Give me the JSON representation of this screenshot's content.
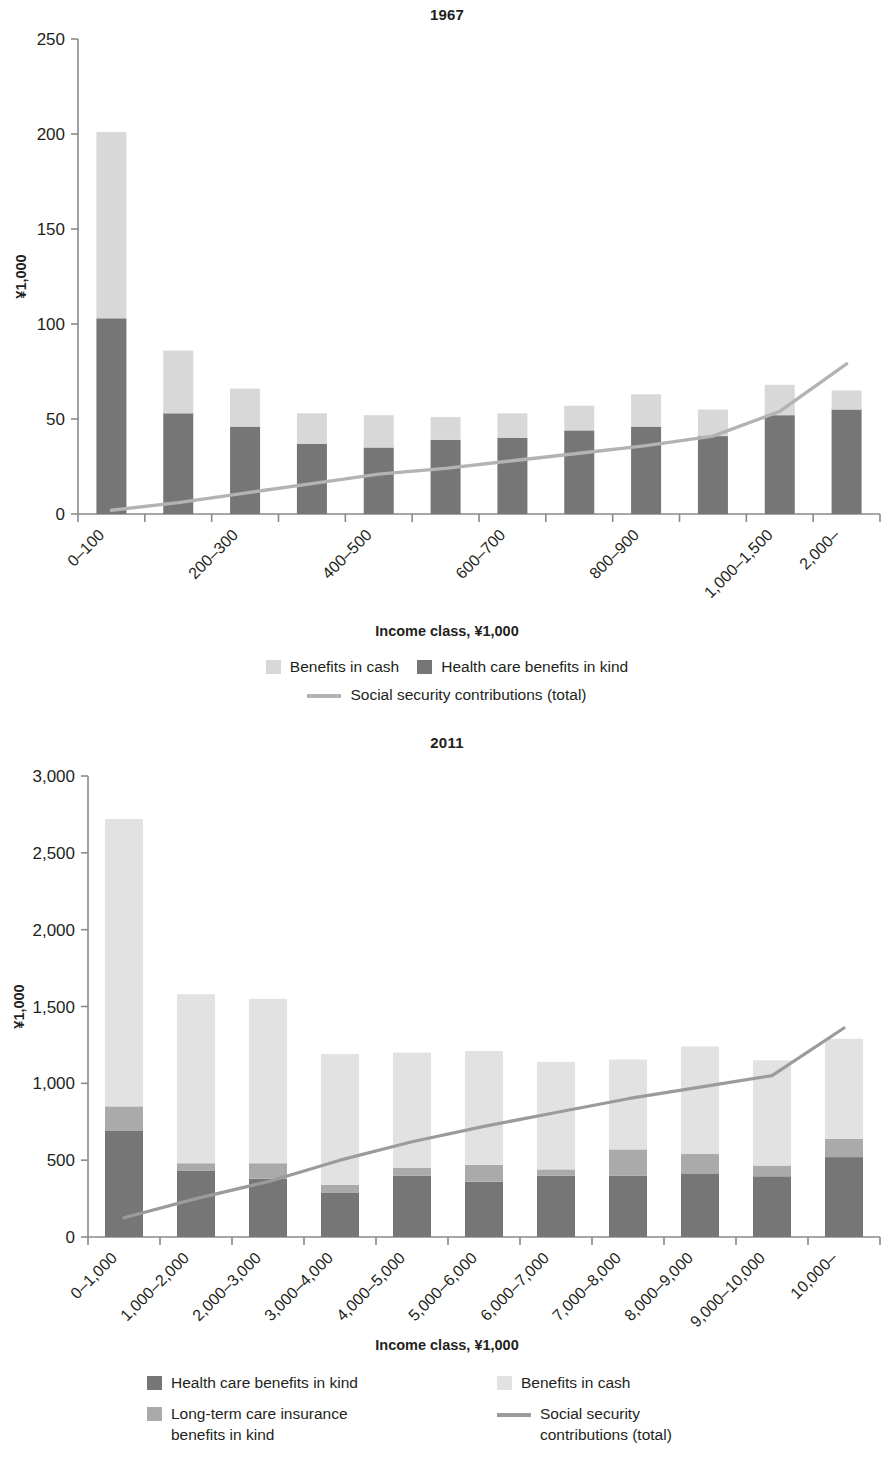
{
  "colors": {
    "dark_gray": "#767676",
    "mid_gray": "#aaaaaa",
    "light_gray": "#d8d8d8",
    "line_gray": "#b3b3b3",
    "line_gray_2011": "#9b9b9b",
    "axis": "#8a8a8a",
    "text": "#231f20"
  },
  "chart_data": [
    {
      "type": "bar",
      "id": "chart-1967",
      "title": "1967",
      "xlabel": "Income class, ¥1,000",
      "ylabel": "¥1,000",
      "ylim": [
        0,
        250
      ],
      "yticks": [
        0,
        50,
        100,
        150,
        200,
        250
      ],
      "ytick_labels": [
        "0",
        "50",
        "100",
        "150",
        "200",
        "250"
      ],
      "grid": false,
      "legend_position": "bottom",
      "stacked": true,
      "categories": [
        "0–100",
        "100–200",
        "200–300",
        "300–400",
        "400–500",
        "500–600",
        "600–700",
        "700–800",
        "800–900",
        "900–1,000",
        "1,000–1,500",
        "2,000–"
      ],
      "visible_tick_labels": [
        "0–100",
        "",
        "200–300",
        "",
        "400–500",
        "",
        "600–700",
        "",
        "800–900",
        "",
        "1,000–1,500",
        "2,000–"
      ],
      "series": [
        {
          "name": "Health care benefits in kind",
          "color": "#767676",
          "values": [
            103,
            53,
            46,
            37,
            35,
            39,
            40,
            44,
            46,
            41,
            52,
            55
          ]
        },
        {
          "name": "Benefits in cash",
          "color": "#d8d8d8",
          "values": [
            98,
            33,
            20,
            16,
            17,
            12,
            13,
            13,
            17,
            14,
            16,
            10
          ]
        }
      ],
      "totals": [
        201,
        86,
        66,
        53,
        52,
        51,
        53,
        57,
        63,
        55,
        68,
        75
      ],
      "line_series": {
        "name": "Social security contributions (total)",
        "color": "#b3b3b3",
        "values": [
          2,
          6,
          11,
          16,
          21,
          24,
          28,
          32,
          36,
          41,
          54,
          79
        ]
      },
      "legend": [
        {
          "label": "Benefits in cash",
          "marker": "swatch",
          "color": "#d8d8d8"
        },
        {
          "label": "Health care benefits in kind",
          "marker": "swatch",
          "color": "#767676"
        },
        {
          "label": "Social security contributions (total)",
          "marker": "line",
          "color": "#b3b3b3"
        }
      ]
    },
    {
      "type": "bar",
      "id": "chart-2011",
      "title": "2011",
      "xlabel": "Income class, ¥1,000",
      "ylabel": "¥1,000",
      "ylim": [
        0,
        3000
      ],
      "yticks": [
        0,
        500,
        1000,
        1500,
        2000,
        2500,
        3000
      ],
      "ytick_labels": [
        "0",
        "500",
        "1,000",
        "1,500",
        "2,000",
        "2,500",
        "3,000"
      ],
      "grid": false,
      "legend_position": "bottom",
      "stacked": true,
      "categories": [
        "0–1,000",
        "1,000–2,000",
        "2,000–3,000",
        "3,000–4,000",
        "4,000–5,000",
        "5,000–6,000",
        "6,000–7,000",
        "7,000–8,000",
        "8,000–9,000",
        "9,000–10,000",
        "10,000–"
      ],
      "visible_tick_labels": [
        "0–1,000",
        "1,000–2,000",
        "2,000–3,000",
        "3,000–4,000",
        "4,000–5,000",
        "5,000–6,000",
        "6,000–7,000",
        "7,000–8,000",
        "8,000–9,000",
        "9,000–10,000",
        "10,000–"
      ],
      "series": [
        {
          "name": "Health care benefits in kind",
          "color": "#767676",
          "values": [
            690,
            430,
            380,
            290,
            400,
            360,
            400,
            400,
            410,
            395,
            520
          ]
        },
        {
          "name": "Long-term care insurance benefits in kind",
          "color": "#aaaaaa",
          "values": [
            160,
            50,
            100,
            50,
            50,
            110,
            40,
            170,
            130,
            70,
            120
          ]
        },
        {
          "name": "Benefits in cash",
          "color": "#e2e2e2",
          "values": [
            1870,
            1100,
            1070,
            850,
            750,
            740,
            700,
            585,
            700,
            685,
            650
          ]
        }
      ],
      "totals": [
        2720,
        1580,
        1550,
        1190,
        1200,
        1210,
        1140,
        1155,
        1240,
        1150,
        1290
      ],
      "line_series": {
        "name": "Social security contributions (total)",
        "color": "#9b9b9b",
        "values": [
          125,
          250,
          360,
          500,
          620,
          720,
          810,
          900,
          975,
          1050,
          1360
        ]
      },
      "legend": [
        {
          "label": "Health care benefits in kind",
          "marker": "swatch",
          "color": "#767676"
        },
        {
          "label": "Benefits in cash",
          "marker": "swatch",
          "color": "#e2e2e2"
        },
        {
          "label": "Long-term care insurance\nbenefits in kind",
          "marker": "swatch",
          "color": "#aaaaaa"
        },
        {
          "label": "Social security\ncontributions (total)",
          "marker": "line",
          "color": "#9b9b9b"
        }
      ]
    }
  ]
}
